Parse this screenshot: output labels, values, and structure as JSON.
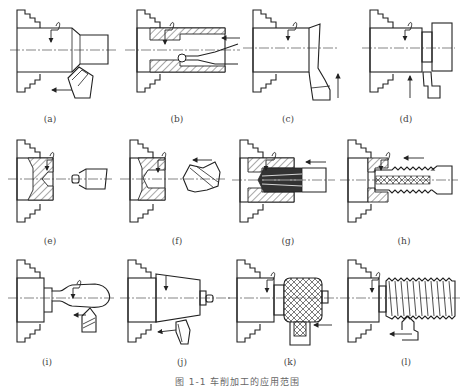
{
  "figure": {
    "caption": "图 1-1  车削加工的应用范围",
    "panels": [
      {
        "id": "a",
        "label": "(a)",
        "operation": "turning-outer-cylinder"
      },
      {
        "id": "b",
        "label": "(b)",
        "operation": "boring-inner-hole"
      },
      {
        "id": "c",
        "label": "(c)",
        "operation": "facing-end-face"
      },
      {
        "id": "d",
        "label": "(d)",
        "operation": "grooving-cutoff"
      },
      {
        "id": "e",
        "label": "(e)",
        "operation": "center-drilling"
      },
      {
        "id": "f",
        "label": "(f)",
        "operation": "drilling"
      },
      {
        "id": "g",
        "label": "(g)",
        "operation": "reaming"
      },
      {
        "id": "h",
        "label": "(h)",
        "operation": "tapping"
      },
      {
        "id": "i",
        "label": "(i)",
        "operation": "form-turning"
      },
      {
        "id": "j",
        "label": "(j)",
        "operation": "taper-turning"
      },
      {
        "id": "k",
        "label": "(k)",
        "operation": "knurling"
      },
      {
        "id": "l",
        "label": "(l)",
        "operation": "thread-turning"
      }
    ]
  }
}
